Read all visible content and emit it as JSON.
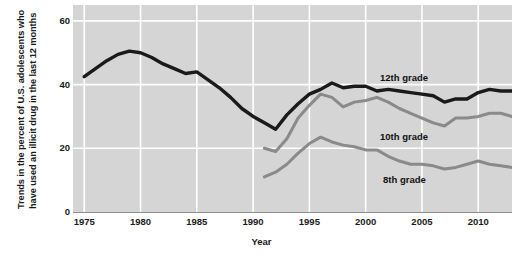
{
  "chart_data": {
    "type": "line",
    "title": "",
    "xlabel": "Year",
    "ylabel": "Trends in the percent of U.S. adolescents who have used an illicit drug in the last 12 months",
    "ylabel_line1": "Trends in the percent of U.S. adolescents who",
    "ylabel_line2": "have used an illicit drug in the last 12 months",
    "xlim": [
      1974,
      2013
    ],
    "ylim": [
      0,
      65
    ],
    "yticks": [
      "0",
      "20",
      "40",
      "60"
    ],
    "ytick_values": [
      0,
      20,
      40,
      60
    ],
    "xticks": [
      "1975",
      "1980",
      "1985",
      "1990",
      "1995",
      "2000",
      "2005",
      "2010"
    ],
    "xtick_values": [
      1975,
      1980,
      1985,
      1990,
      1995,
      2000,
      2005,
      2010
    ],
    "grid": true,
    "grid_color": "#ffffff",
    "plot_background": "#d5d5d5",
    "legend_position": "inline-annotations",
    "series": [
      {
        "name": "12th grade",
        "color": "#1a1a1a",
        "width": 3.4,
        "x": [
          1975,
          1976,
          1977,
          1978,
          1979,
          1980,
          1981,
          1982,
          1983,
          1984,
          1985,
          1986,
          1987,
          1988,
          1989,
          1990,
          1991,
          1992,
          1993,
          1994,
          1995,
          1996,
          1997,
          1998,
          1999,
          2000,
          2001,
          2002,
          2003,
          2004,
          2005,
          2006,
          2007,
          2008,
          2009,
          2010,
          2011,
          2012,
          2013
        ],
        "values": [
          42.5,
          45.0,
          47.5,
          49.5,
          50.5,
          50.0,
          48.5,
          46.5,
          45.0,
          43.5,
          44.0,
          41.5,
          39.0,
          36.0,
          32.5,
          30.0,
          28.0,
          26.0,
          30.5,
          34.0,
          37.0,
          38.5,
          40.5,
          39.0,
          39.5,
          39.5,
          38.0,
          38.5,
          38.0,
          37.5,
          37.0,
          36.5,
          34.5,
          35.5,
          35.5,
          37.5,
          38.5,
          38.0,
          38.0
        ]
      },
      {
        "name": "10th grade",
        "color": "#8a8a8a",
        "width": 3.0,
        "x": [
          1991,
          1992,
          1993,
          1994,
          1995,
          1996,
          1997,
          1998,
          1999,
          2000,
          2001,
          2002,
          2003,
          2004,
          2005,
          2006,
          2007,
          2008,
          2009,
          2010,
          2011,
          2012,
          2013
        ],
        "values": [
          20.0,
          19.0,
          23.0,
          29.5,
          33.5,
          37.0,
          36.0,
          33.0,
          34.5,
          35.0,
          36.0,
          34.5,
          32.5,
          31.0,
          29.5,
          28.0,
          27.0,
          29.5,
          29.5,
          30.0,
          31.0,
          31.0,
          30.0
        ]
      },
      {
        "name": "8th grade",
        "color": "#8a8a8a",
        "width": 3.0,
        "x": [
          1991,
          1992,
          1993,
          1994,
          1995,
          1996,
          1997,
          1998,
          1999,
          2000,
          2001,
          2002,
          2003,
          2004,
          2005,
          2006,
          2007,
          2008,
          2009,
          2010,
          2011,
          2012,
          2013
        ],
        "values": [
          11.0,
          12.5,
          15.0,
          18.5,
          21.5,
          23.5,
          22.0,
          21.0,
          20.5,
          19.5,
          19.5,
          17.5,
          16.0,
          15.0,
          15.0,
          14.5,
          13.5,
          14.0,
          15.0,
          16.0,
          15.0,
          14.5,
          14.0
        ]
      }
    ],
    "annotations": [
      {
        "text": "12th grade",
        "series": "12th grade"
      },
      {
        "text": "10th grade",
        "series": "10th grade"
      },
      {
        "text": "8th grade",
        "series": "8th grade"
      }
    ]
  }
}
